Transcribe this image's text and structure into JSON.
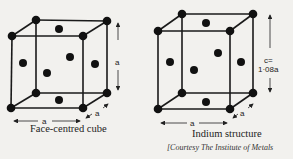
{
  "figures": [
    {
      "id": "fcc",
      "caption": "Face-centred cube",
      "dimension_labels": {
        "width": "a",
        "height": "a",
        "depth": "a"
      },
      "corners": {
        "ftl": [
          12,
          36
        ],
        "ftr": [
          83,
          36
        ],
        "fbl": [
          11,
          108
        ],
        "fbr": [
          83,
          108
        ],
        "btl": [
          36,
          20
        ],
        "btr": [
          107,
          21
        ],
        "bbl": [
          36,
          93
        ],
        "bbr": [
          107,
          93
        ]
      },
      "face_centers": [
        [
          59,
          29
        ],
        [
          23,
          63
        ],
        [
          47,
          73
        ],
        [
          70,
          57
        ],
        [
          95,
          64
        ],
        [
          59,
          100
        ]
      ]
    },
    {
      "id": "indium",
      "caption": "Indium structure",
      "dimension_labels": {
        "width": "a",
        "height_line1": "c=",
        "height_line2": "1·08a",
        "depth": "a"
      },
      "corners": {
        "ftl": [
          158,
          31
        ],
        "ftr": [
          230,
          31
        ],
        "fbl": [
          158,
          109
        ],
        "fbr": [
          230,
          109
        ],
        "btl": [
          182,
          14
        ],
        "btr": [
          253,
          14
        ],
        "bbl": [
          182,
          93
        ],
        "bbr": [
          253,
          93
        ]
      },
      "face_centers": [
        [
          206,
          23
        ],
        [
          170,
          62
        ],
        [
          194,
          70
        ],
        [
          218,
          53
        ],
        [
          241,
          62
        ],
        [
          206,
          102
        ]
      ]
    }
  ],
  "credit": "[Courtesy The Institute of Metals",
  "colors": {
    "atom": "#111111",
    "line": "#1a1a1a",
    "background": "#f2f1ee"
  }
}
